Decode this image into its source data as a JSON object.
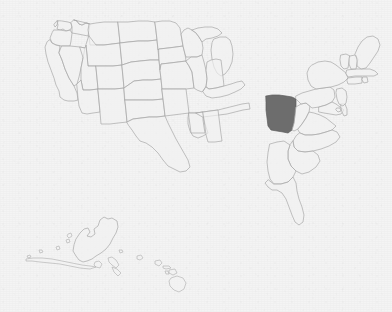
{
  "map": {
    "kind": "choropleth-locator-map",
    "region_title": "United States",
    "selected_state": "Ohio",
    "selected_state_abbr": "OH",
    "selected_count": 1,
    "total_states_drawn": 51,
    "has_labels": false,
    "has_legend": false,
    "has_title_text": false,
    "insets": [
      "Alaska",
      "Hawaii"
    ],
    "colors": {
      "background": "#f3f3f3",
      "state_fill": "#f1f1f1",
      "state_border": "#a8a8a8",
      "selected_fill": "#6d6d6d",
      "selected_border": "#5c5c5c"
    },
    "states": [
      {
        "abbr": "WA",
        "name": "Washington",
        "selected": false
      },
      {
        "abbr": "OR",
        "name": "Oregon",
        "selected": false
      },
      {
        "abbr": "CA",
        "name": "California",
        "selected": false
      },
      {
        "abbr": "NV",
        "name": "Nevada",
        "selected": false
      },
      {
        "abbr": "ID",
        "name": "Idaho",
        "selected": false
      },
      {
        "abbr": "MT",
        "name": "Montana",
        "selected": false
      },
      {
        "abbr": "WY",
        "name": "Wyoming",
        "selected": false
      },
      {
        "abbr": "UT",
        "name": "Utah",
        "selected": false
      },
      {
        "abbr": "AZ",
        "name": "Arizona",
        "selected": false
      },
      {
        "abbr": "CO",
        "name": "Colorado",
        "selected": false
      },
      {
        "abbr": "NM",
        "name": "New Mexico",
        "selected": false
      },
      {
        "abbr": "ND",
        "name": "North Dakota",
        "selected": false
      },
      {
        "abbr": "SD",
        "name": "South Dakota",
        "selected": false
      },
      {
        "abbr": "NE",
        "name": "Nebraska",
        "selected": false
      },
      {
        "abbr": "KS",
        "name": "Kansas",
        "selected": false
      },
      {
        "abbr": "OK",
        "name": "Oklahoma",
        "selected": false
      },
      {
        "abbr": "TX",
        "name": "Texas",
        "selected": false
      },
      {
        "abbr": "MN",
        "name": "Minnesota",
        "selected": false
      },
      {
        "abbr": "IA",
        "name": "Iowa",
        "selected": false
      },
      {
        "abbr": "MO",
        "name": "Missouri",
        "selected": false
      },
      {
        "abbr": "AR",
        "name": "Arkansas",
        "selected": false
      },
      {
        "abbr": "LA",
        "name": "Louisiana",
        "selected": false
      },
      {
        "abbr": "WI",
        "name": "Wisconsin",
        "selected": false
      },
      {
        "abbr": "IL",
        "name": "Illinois",
        "selected": false
      },
      {
        "abbr": "MS",
        "name": "Mississippi",
        "selected": false
      },
      {
        "abbr": "MI",
        "name": "Michigan",
        "selected": false
      },
      {
        "abbr": "IN",
        "name": "Indiana",
        "selected": false
      },
      {
        "abbr": "KY",
        "name": "Kentucky",
        "selected": false
      },
      {
        "abbr": "TN",
        "name": "Tennessee",
        "selected": false
      },
      {
        "abbr": "AL",
        "name": "Alabama",
        "selected": false
      },
      {
        "abbr": "OH",
        "name": "Ohio",
        "selected": true
      },
      {
        "abbr": "WV",
        "name": "West Virginia",
        "selected": false
      },
      {
        "abbr": "VA",
        "name": "Virginia",
        "selected": false
      },
      {
        "abbr": "NC",
        "name": "North Carolina",
        "selected": false
      },
      {
        "abbr": "SC",
        "name": "South Carolina",
        "selected": false
      },
      {
        "abbr": "GA",
        "name": "Georgia",
        "selected": false
      },
      {
        "abbr": "FL",
        "name": "Florida",
        "selected": false
      },
      {
        "abbr": "PA",
        "name": "Pennsylvania",
        "selected": false
      },
      {
        "abbr": "NY",
        "name": "New York",
        "selected": false
      },
      {
        "abbr": "MD",
        "name": "Maryland",
        "selected": false
      },
      {
        "abbr": "DE",
        "name": "Delaware",
        "selected": false
      },
      {
        "abbr": "NJ",
        "name": "New Jersey",
        "selected": false
      },
      {
        "abbr": "CT",
        "name": "Connecticut",
        "selected": false
      },
      {
        "abbr": "RI",
        "name": "Rhode Island",
        "selected": false
      },
      {
        "abbr": "MA",
        "name": "Massachusetts",
        "selected": false
      },
      {
        "abbr": "VT",
        "name": "Vermont",
        "selected": false
      },
      {
        "abbr": "NH",
        "name": "New Hampshire",
        "selected": false
      },
      {
        "abbr": "ME",
        "name": "Maine",
        "selected": false
      },
      {
        "abbr": "AK",
        "name": "Alaska",
        "selected": false
      },
      {
        "abbr": "HI",
        "name": "Hawaii",
        "selected": false
      },
      {
        "abbr": "DC",
        "name": "District of Columbia",
        "selected": false
      }
    ],
    "accessible_caption": "Map of the United States with Ohio shaded in dark gray."
  }
}
